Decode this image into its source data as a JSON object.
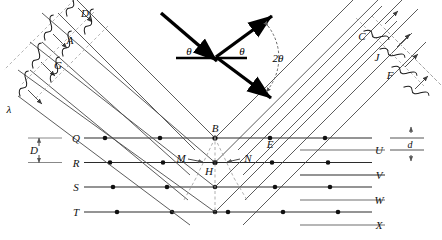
{
  "figure": {
    "type": "physics-ray-diagram",
    "colors": {
      "ray": "#4a4a4a",
      "lattice_line": "#2b2b2b",
      "lattice_line_light": "#8a8a8a",
      "atom": "#111111",
      "dashed": "#9a9a9a",
      "vector": "#000000",
      "background": "#ffffff"
    }
  },
  "labels": {
    "incident_wavefronts": [
      {
        "id": "label-D",
        "text": "D"
      },
      {
        "id": "label-A",
        "text": "A"
      },
      {
        "id": "label-G",
        "text": "G"
      }
    ],
    "wavelength": {
      "id": "label-lambda",
      "text": "λ"
    },
    "outgoing_wavefronts": [
      {
        "id": "label-C",
        "text": "C"
      },
      {
        "id": "label-J",
        "text": "J"
      },
      {
        "id": "label-F",
        "text": "F"
      }
    ],
    "lattice_left": [
      {
        "id": "row-Q",
        "text": "Q"
      },
      {
        "id": "row-R",
        "text": "R"
      },
      {
        "id": "row-S",
        "text": "S"
      },
      {
        "id": "row-T",
        "text": "T"
      }
    ],
    "lattice_right": [
      {
        "id": "row-U",
        "text": "U"
      },
      {
        "id": "row-V",
        "text": "V"
      },
      {
        "id": "row-W",
        "text": "W"
      },
      {
        "id": "row-X",
        "text": "X"
      }
    ],
    "scatter_points": [
      {
        "id": "point-B",
        "text": "B"
      },
      {
        "id": "point-E",
        "text": "E"
      },
      {
        "id": "point-M",
        "text": "M"
      },
      {
        "id": "point-N",
        "text": "N"
      },
      {
        "id": "point-H",
        "text": "H"
      }
    ],
    "spacings": [
      {
        "id": "spacing-D",
        "text": "D",
        "side": "left"
      },
      {
        "id": "spacing-d",
        "text": "d",
        "side": "right"
      }
    ],
    "angles": [
      {
        "id": "angle-incident",
        "text": "θ"
      },
      {
        "id": "angle-reflected",
        "text": "θ"
      },
      {
        "id": "angle-total",
        "text": "2θ"
      }
    ]
  },
  "geometry": {
    "lattice_rows_y": [
      138,
      162.5,
      187,
      212
    ],
    "lattice_right_rows_y": [
      150,
      175,
      200,
      225
    ],
    "row_label_x_left": 68,
    "row_label_x_right": 395,
    "atom_spacing": 44,
    "apex_x": 215,
    "ray_angle_deg": 45,
    "num_rays": 4
  }
}
